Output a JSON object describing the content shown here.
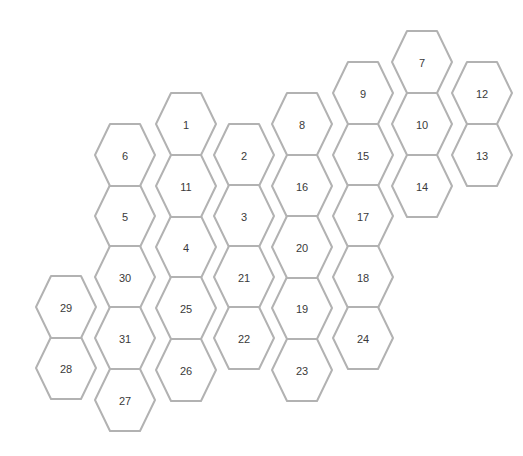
{
  "grid": {
    "kind": "hexagon-tile-map",
    "background_color": "#ffffff",
    "cell_fill_color": "#ffffff",
    "cell_border_color": "#b2b2b2",
    "cell_border_width": 2,
    "label_color": "#3a3a3a",
    "label_font_size": 11,
    "hex_orientation": "pointy-left-right-flat-top-bottom",
    "hex_width": 60,
    "hex_height": 62,
    "column_step_x": 59,
    "row_step_y": 62,
    "column_offset_y": 31,
    "cell_count": 31,
    "cells": [
      {
        "label": "1",
        "cx": 186,
        "cy": 124
      },
      {
        "label": "2",
        "cx": 244,
        "cy": 155
      },
      {
        "label": "3",
        "cx": 244,
        "cy": 216
      },
      {
        "label": "4",
        "cx": 186,
        "cy": 247
      },
      {
        "label": "5",
        "cx": 125,
        "cy": 216
      },
      {
        "label": "6",
        "cx": 125,
        "cy": 155
      },
      {
        "label": "7",
        "cx": 422,
        "cy": 62
      },
      {
        "label": "8",
        "cx": 302,
        "cy": 124
      },
      {
        "label": "9",
        "cx": 363,
        "cy": 93
      },
      {
        "label": "10",
        "cx": 422,
        "cy": 124
      },
      {
        "label": "11",
        "cx": 186,
        "cy": 186
      },
      {
        "label": "12",
        "cx": 482,
        "cy": 93
      },
      {
        "label": "13",
        "cx": 482,
        "cy": 155
      },
      {
        "label": "14",
        "cx": 422,
        "cy": 186
      },
      {
        "label": "15",
        "cx": 363,
        "cy": 155
      },
      {
        "label": "16",
        "cx": 302,
        "cy": 186
      },
      {
        "label": "17",
        "cx": 363,
        "cy": 216
      },
      {
        "label": "18",
        "cx": 363,
        "cy": 277
      },
      {
        "label": "19",
        "cx": 302,
        "cy": 308
      },
      {
        "label": "20",
        "cx": 302,
        "cy": 247
      },
      {
        "label": "21",
        "cx": 244,
        "cy": 277
      },
      {
        "label": "22",
        "cx": 244,
        "cy": 338
      },
      {
        "label": "23",
        "cx": 302,
        "cy": 370
      },
      {
        "label": "24",
        "cx": 363,
        "cy": 338
      },
      {
        "label": "25",
        "cx": 186,
        "cy": 308
      },
      {
        "label": "26",
        "cx": 186,
        "cy": 370
      },
      {
        "label": "27",
        "cx": 125,
        "cy": 400
      },
      {
        "label": "28",
        "cx": 66,
        "cy": 368
      },
      {
        "label": "29",
        "cx": 66,
        "cy": 307
      },
      {
        "label": "30",
        "cx": 125,
        "cy": 277
      },
      {
        "label": "31",
        "cx": 125,
        "cy": 338
      }
    ]
  }
}
